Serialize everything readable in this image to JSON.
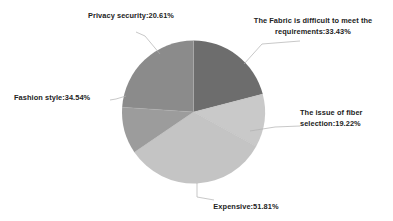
{
  "chart_data": {
    "type": "pie",
    "title": "",
    "subtitle": "",
    "xlabel": "",
    "ylabel": "",
    "legend_position": "none",
    "grid": false,
    "note": "Multiple-response survey; percentages sum to more than 100%.",
    "categories": [
      "The Fabric is difficult to meet the requirements",
      "The issue of fiber selection",
      "Expensive",
      "Fashion style",
      "Privacy security"
    ],
    "values": [
      33.43,
      19.22,
      51.81,
      34.54,
      20.61
    ],
    "value_unit": "%",
    "colors": [
      "#6d6d6d",
      "#c9c9c9",
      "#c4c4c4",
      "#9c9c9c",
      "#8b8b8b"
    ],
    "slices": [
      {
        "name": "The Fabric is difficult to meet the requirements",
        "value": 33.43,
        "label": "The Fabric is difficult to meet the\nrequirements:33.43%",
        "color": "#6d6d6d",
        "start_angle": 0,
        "end_angle": 75.5
      },
      {
        "name": "The issue of fiber selection",
        "value": 19.22,
        "label": "The issue of fiber\nselection:19.22%",
        "color": "#c9c9c9",
        "start_angle": 75.5,
        "end_angle": 118.8
      },
      {
        "name": "Expensive",
        "value": 51.81,
        "label": "Expensive:51.81%",
        "color": "#c4c4c4",
        "start_angle": 118.8,
        "end_angle": 235.8
      },
      {
        "name": "Fashion style",
        "value": 34.54,
        "label": "Fashion style:34.54%",
        "color": "#9c9c9c",
        "start_angle": 235.8,
        "end_angle": 273.8
      },
      {
        "name": "Privacy security",
        "value": 20.61,
        "label": "Privacy security:20.61%",
        "color": "#8b8b8b",
        "start_angle": 273.8,
        "end_angle": 360
      }
    ]
  },
  "labels": {
    "fabric": "The Fabric is difficult to meet the\nrequirements:33.43%",
    "fiber": "The issue of fiber\nselection:19.22%",
    "expensive": "Expensive:51.81%",
    "fashion": "Fashion style:34.54%",
    "privacy": "Privacy security:20.61%"
  }
}
